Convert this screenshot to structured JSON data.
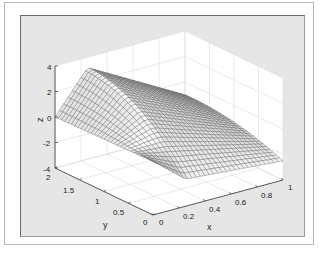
{
  "chart_data": {
    "type": "surface",
    "title": "",
    "xlabel": "x",
    "ylabel": "y",
    "zlabel": "z",
    "xlim": [
      0,
      1
    ],
    "ylim": [
      0,
      2
    ],
    "zlim": [
      -4,
      4
    ],
    "x_ticks": [
      "0",
      "0.2",
      "0.4",
      "0.6",
      "0.8",
      "1"
    ],
    "y_ticks": [
      "0",
      "0.5",
      "1",
      "1.5",
      "2"
    ],
    "z_ticks": [
      "-4",
      "-2",
      "0",
      "2",
      "4"
    ],
    "grid": true,
    "colormap": "gray"
  },
  "axes": {
    "x_label": "x",
    "y_label": "y",
    "z_label": "z",
    "x_ticks": [
      "0",
      "0.2",
      "0.4",
      "0.6",
      "0.8",
      "1"
    ],
    "y_ticks": [
      "0",
      "0.5",
      "1",
      "1.5",
      "2"
    ],
    "z_ticks": [
      "-4",
      "-2",
      "0",
      "2",
      "4"
    ]
  }
}
